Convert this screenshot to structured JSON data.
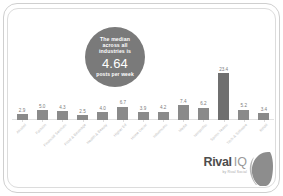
{
  "card": {
    "background": "#ffffff",
    "frame_color": "#cfcfcf"
  },
  "callout": {
    "line1": "The median",
    "line2": "across all",
    "line3": "industries is",
    "value": "4.64",
    "unit": "posts per week",
    "fill": "#7a7a7a",
    "text_color": "#ffffff"
  },
  "logo": {
    "name": "Rival",
    "mark": "IQ",
    "tagline": "by Rival Social",
    "color": "#4d4d4d",
    "mark_color": "#9a9a9a"
  },
  "chart_data": {
    "type": "bar",
    "title": "",
    "xlabel": "",
    "ylabel": "",
    "ylim": [
      0,
      24
    ],
    "grid": false,
    "legend": null,
    "bar_color": "#8a8a8a",
    "highlight_color": "#6f6f6f",
    "median": 4.64,
    "median_label": "4.64 posts per week",
    "categories": [
      "Alcohol",
      "Fashion",
      "Financial Services",
      "Food & Beverage",
      "Health & Beauty",
      "Higher Ed",
      "Home Decor",
      "Influencers",
      "Media",
      "Nonprofits",
      "Sports Teams",
      "Tech & Software",
      "Retail"
    ],
    "values": [
      2.9,
      5.0,
      4.3,
      2.5,
      4.0,
      6.7,
      3.9,
      4.2,
      7.4,
      6.2,
      23.4,
      5.2,
      3.4
    ],
    "value_labels": [
      "2.9",
      "5.0",
      "4.3",
      "2.5",
      "4.0",
      "6.7",
      "3.9",
      "4.2",
      "7.4",
      "6.2",
      "23.4",
      "5.2",
      "3.4"
    ],
    "max_value": 23.4,
    "max_index": 10
  }
}
